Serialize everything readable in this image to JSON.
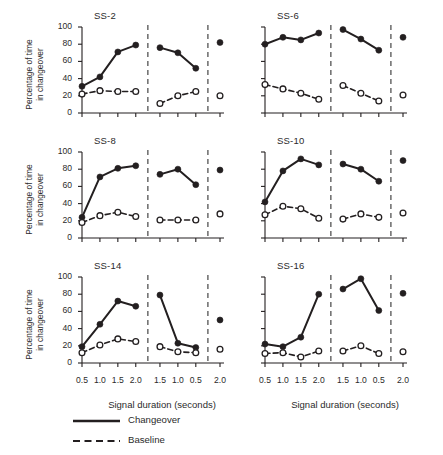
{
  "figure": {
    "ylabel": "Percentage of time\nin changeover",
    "ylabel_line1": "Percentage of time",
    "ylabel_line2": "in changeover",
    "xlabel_left": "Signal duration (seconds)",
    "xlabel_right": "Signal duration (seconds)",
    "legend": {
      "changeover": "Changeover",
      "baseline": "Baseline"
    },
    "colors": {
      "ink": "#231f20",
      "open_marker_fill": "#ffffff",
      "divider": "#4d4d4d",
      "background": "#ffffff"
    }
  },
  "chart_data": {
    "type": "line",
    "title": "",
    "xlabel": "Signal duration (seconds)",
    "ylabel": "Percentage of time in changeover",
    "ylim": [
      0,
      100
    ],
    "yticks": [
      0,
      20,
      40,
      60,
      80,
      100
    ],
    "xtick_labels": [
      "0.5",
      "1.0",
      "1.5",
      "2.0",
      "1.5",
      "1.0",
      "0.5",
      "2.0"
    ],
    "x_positions": [
      0,
      1,
      2,
      3,
      4.35,
      5.35,
      6.35,
      7.7
    ],
    "grid": false,
    "legend_position": "below-axes",
    "phase_dividers_after_index": [
      3,
      6
    ],
    "series_names": [
      "Changeover",
      "Baseline"
    ],
    "panels": [
      {
        "name": "SS-2",
        "row": 0,
        "col": 0,
        "series": [
          {
            "name": "Changeover",
            "style": "solid",
            "marker": "filled-circle",
            "values": [
              31,
              42,
              71,
              79,
              76,
              70,
              52,
              82
            ]
          },
          {
            "name": "Baseline",
            "style": "dashed",
            "marker": "open-circle",
            "values": [
              22,
              26,
              25,
              25,
              11,
              20,
              25,
              20
            ]
          }
        ]
      },
      {
        "name": "SS-6",
        "row": 0,
        "col": 1,
        "series": [
          {
            "name": "Changeover",
            "style": "solid",
            "marker": "filled-circle",
            "values": [
              80,
              88,
              85,
              93,
              97,
              86,
              73,
              88
            ]
          },
          {
            "name": "Baseline",
            "style": "dashed",
            "marker": "open-circle",
            "values": [
              33,
              28,
              23,
              16,
              32,
              23,
              14,
              21
            ]
          }
        ]
      },
      {
        "name": "SS-8",
        "row": 1,
        "col": 0,
        "series": [
          {
            "name": "Changeover",
            "style": "solid",
            "marker": "filled-circle",
            "values": [
              24,
              71,
              81,
              84,
              74,
              80,
              62,
              79
            ]
          },
          {
            "name": "Baseline",
            "style": "dashed",
            "marker": "open-circle",
            "values": [
              18,
              26,
              30,
              25,
              21,
              21,
              21,
              28
            ]
          }
        ]
      },
      {
        "name": "SS-10",
        "row": 1,
        "col": 1,
        "series": [
          {
            "name": "Changeover",
            "style": "solid",
            "marker": "filled-circle",
            "values": [
              42,
              78,
              92,
              85,
              86,
              80,
              66,
              90
            ]
          },
          {
            "name": "Baseline",
            "style": "dashed",
            "marker": "open-circle",
            "values": [
              27,
              37,
              34,
              23,
              22,
              28,
              24,
              29
            ]
          }
        ]
      },
      {
        "name": "SS-14",
        "row": 2,
        "col": 0,
        "series": [
          {
            "name": "Changeover",
            "style": "solid",
            "marker": "filled-circle",
            "values": [
              19,
              45,
              72,
              66,
              79,
              23,
              18,
              50
            ]
          },
          {
            "name": "Baseline",
            "style": "dashed",
            "marker": "open-circle",
            "values": [
              12,
              21,
              28,
              25,
              19,
              13,
              12,
              16
            ]
          }
        ]
      },
      {
        "name": "SS-16",
        "row": 2,
        "col": 1,
        "series": [
          {
            "name": "Changeover",
            "style": "solid",
            "marker": "filled-circle",
            "values": [
              22,
              19,
              30,
              80,
              86,
              98,
              61,
              81
            ]
          },
          {
            "name": "Baseline",
            "style": "dashed",
            "marker": "open-circle",
            "values": [
              11,
              12,
              7,
              14,
              14,
              20,
              11,
              13
            ]
          }
        ]
      }
    ]
  }
}
